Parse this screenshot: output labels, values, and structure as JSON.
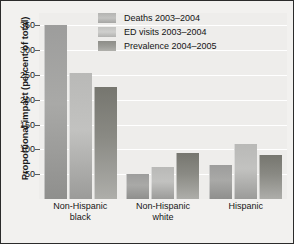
{
  "chart_data": {
    "type": "bar",
    "title": "",
    "xlabel": "",
    "ylabel": "Proportional impact (percent of total)",
    "ylim": [
      0,
      375
    ],
    "yticks": [
      50,
      100,
      150,
      200,
      250,
      300,
      350
    ],
    "ytick_labels": [
      "50",
      "100",
      "150",
      "200",
      "250",
      "300",
      "350"
    ],
    "grid": true,
    "legend_position": "top-center",
    "categories": [
      "Non-Hispanic black",
      "Non-Hispanic white",
      "Hispanic"
    ],
    "category_lines": [
      [
        "Non-Hispanic",
        "black"
      ],
      [
        "Non-Hispanic",
        "white"
      ],
      [
        "Hispanic",
        ""
      ]
    ],
    "series": [
      {
        "name": "Deaths 2003–2004",
        "color": "#a9a9a7",
        "values": [
          350,
          50,
          68
        ]
      },
      {
        "name": "ED visits 2003–2004",
        "color": "#c2c2c0",
        "values": [
          255,
          65,
          110
        ]
      },
      {
        "name": "Prevalence 2004–2005",
        "color": "#8a8a84",
        "values": [
          225,
          92,
          88
        ]
      }
    ]
  },
  "colors": {
    "figure_background": "#f2f1ef",
    "plot_background": "#eeedeb",
    "gridline": "#ffffff",
    "border": "#2b2b2b",
    "text": "#161616"
  }
}
